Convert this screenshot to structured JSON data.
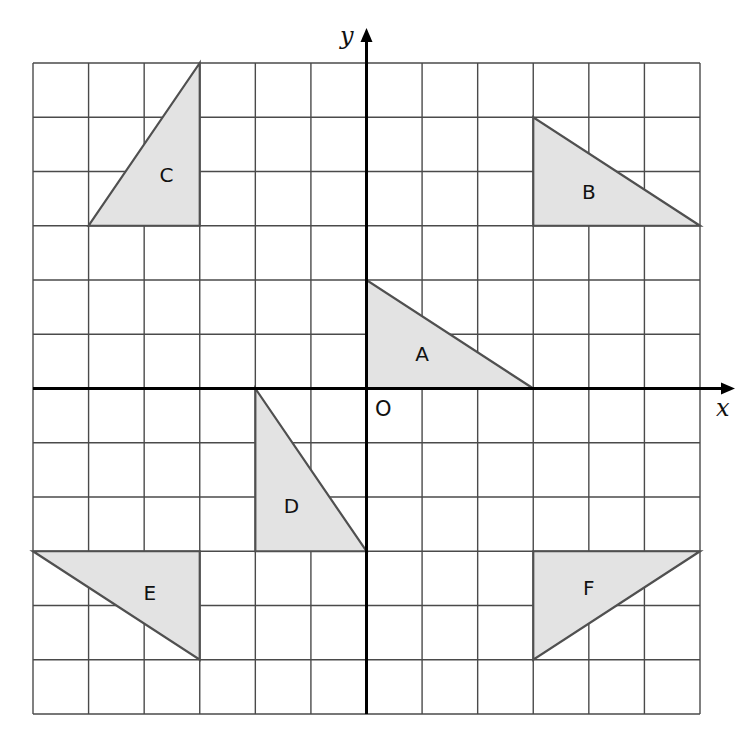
{
  "diagram": {
    "type": "coordinate-grid",
    "grid": {
      "x_min": -6,
      "x_max": 6,
      "y_min": -6,
      "y_max": 6,
      "step": 1,
      "pixel_left": 33,
      "pixel_right": 700,
      "pixel_top": 63,
      "pixel_bottom": 714
    },
    "axes": {
      "x_label": "x",
      "y_label": "y",
      "origin_label": "O"
    },
    "colors": {
      "shape_fill": "#e3e3e3",
      "shape_stroke": "#505050",
      "grid": "#4a4a4a",
      "axis": "#000000"
    },
    "shapes": [
      {
        "name": "A",
        "vertices": [
          [
            0,
            0
          ],
          [
            0,
            2
          ],
          [
            3,
            0
          ]
        ],
        "label_pos": [
          1.0,
          0.6
        ]
      },
      {
        "name": "B",
        "vertices": [
          [
            3,
            3
          ],
          [
            3,
            5
          ],
          [
            6,
            3
          ]
        ],
        "label_pos": [
          4.0,
          3.6
        ]
      },
      {
        "name": "C",
        "vertices": [
          [
            -5,
            3
          ],
          [
            -3,
            3
          ],
          [
            -3,
            6
          ]
        ],
        "label_pos": [
          -3.6,
          3.9
        ]
      },
      {
        "name": "D",
        "vertices": [
          [
            -2,
            0
          ],
          [
            -2,
            -3
          ],
          [
            0,
            -3
          ]
        ],
        "label_pos": [
          -1.35,
          -2.2
        ]
      },
      {
        "name": "E",
        "vertices": [
          [
            -6,
            -3
          ],
          [
            -3,
            -3
          ],
          [
            -3,
            -5
          ]
        ],
        "label_pos": [
          -3.9,
          -3.8
        ]
      },
      {
        "name": "F",
        "vertices": [
          [
            3,
            -3
          ],
          [
            6,
            -3
          ],
          [
            3,
            -5
          ]
        ],
        "label_pos": [
          4.0,
          -3.7
        ]
      }
    ]
  }
}
